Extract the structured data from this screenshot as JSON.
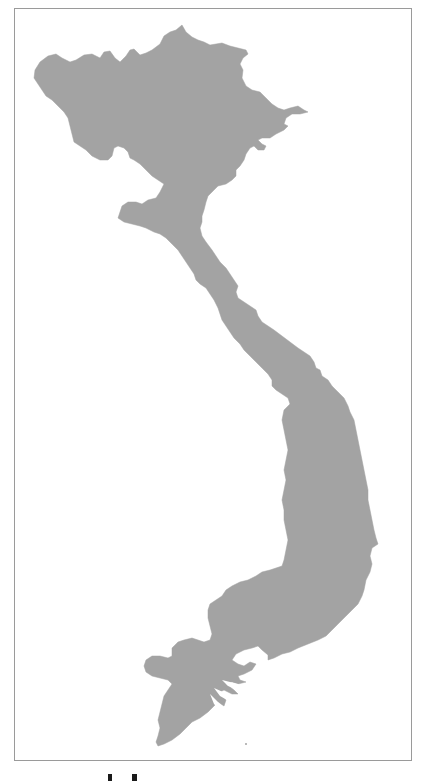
{
  "map": {
    "subject": "Vietnam country outline",
    "fill_color": "#a3a3a3",
    "background_color": "#ffffff",
    "frame_color": "#9a9a9a",
    "frame": {
      "x": 14,
      "y": 8,
      "width": 398,
      "height": 753
    }
  },
  "caption": {
    "visible_text": "",
    "note": "cut-off caption glyph fragments below frame"
  }
}
